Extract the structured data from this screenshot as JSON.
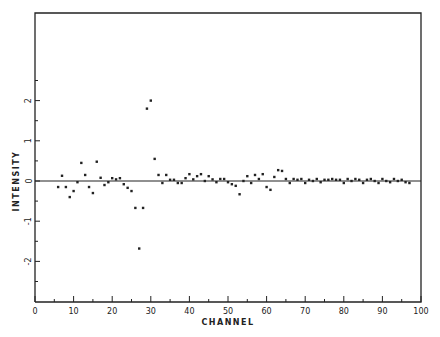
{
  "chart_data": {
    "type": "scatter",
    "title": "",
    "xlabel": "CHANNEL",
    "ylabel": "INTENSITY",
    "xlim": [
      0,
      100
    ],
    "ylim": [
      -3,
      3.5
    ],
    "grid": false,
    "legend": null,
    "zero_line": true,
    "x_major_ticks": [
      0,
      10,
      20,
      30,
      40,
      50,
      60,
      70,
      80,
      90,
      100
    ],
    "x_minor_ticks": [
      5,
      15,
      25,
      35,
      45,
      55,
      65,
      75,
      85,
      95
    ],
    "y_major_ticks": [
      -2,
      -1,
      0,
      1,
      2
    ],
    "y_minor_ticks": [
      -2.5,
      -1.5,
      -0.5,
      0.5,
      1.5,
      2.5
    ],
    "series": [
      {
        "name": "intensity",
        "x": [
          6,
          7,
          8,
          9,
          10,
          11,
          12,
          13,
          14,
          15,
          16,
          17,
          18,
          19,
          20,
          21,
          22,
          23,
          24,
          25,
          26,
          27,
          28,
          29,
          30,
          31,
          32,
          33,
          34,
          35,
          36,
          37,
          38,
          39,
          40,
          41,
          42,
          43,
          44,
          45,
          46,
          47,
          48,
          49,
          50,
          51,
          52,
          53,
          54,
          55,
          56,
          57,
          58,
          59,
          60,
          61,
          62,
          63,
          64,
          65,
          66,
          67,
          68,
          69,
          70,
          71,
          72,
          73,
          74,
          75,
          76,
          77,
          78,
          79,
          80,
          81,
          82,
          83,
          84,
          85,
          86,
          87,
          88,
          89,
          90,
          91,
          92,
          93,
          94,
          95,
          96,
          97
        ],
        "y": [
          -0.15,
          0.13,
          -0.15,
          -0.4,
          -0.25,
          -0.03,
          0.45,
          0.15,
          -0.15,
          -0.3,
          0.48,
          0.08,
          -0.1,
          -0.03,
          0.07,
          0.04,
          0.07,
          -0.08,
          -0.17,
          -0.25,
          -0.67,
          -1.68,
          -0.67,
          1.8,
          2.0,
          0.55,
          0.15,
          -0.05,
          0.15,
          0.03,
          0.03,
          -0.05,
          -0.05,
          0.07,
          0.17,
          0.04,
          0.12,
          0.17,
          0.0,
          0.12,
          0.04,
          -0.03,
          0.05,
          0.05,
          -0.03,
          -0.08,
          -0.12,
          -0.33,
          0.0,
          0.12,
          -0.05,
          0.15,
          0.05,
          0.17,
          -0.15,
          -0.22,
          0.1,
          0.27,
          0.25,
          0.05,
          -0.05,
          0.05,
          0.03,
          0.05,
          -0.05,
          0.03,
          0.0,
          0.05,
          -0.03,
          0.03,
          0.03,
          0.05,
          0.03,
          0.03,
          -0.05,
          0.05,
          0.0,
          0.05,
          0.03,
          -0.05,
          0.03,
          0.05,
          0.0,
          -0.05,
          0.05,
          0.0,
          -0.03,
          0.05,
          0.0,
          0.03,
          -0.03,
          -0.05
        ]
      }
    ],
    "colors": {
      "ink": "#222222",
      "background": "#ffffff"
    }
  }
}
